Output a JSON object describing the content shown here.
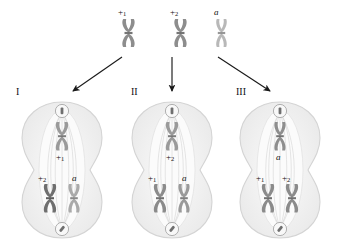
{
  "figure": {
    "background": "#ffffff"
  },
  "parents": {
    "items": [
      {
        "id": "p1",
        "label": "+",
        "sub": "1",
        "italic": false,
        "shade": "#8d8d8d",
        "x": 120,
        "y": 18
      },
      {
        "id": "p2",
        "label": "+",
        "sub": "2",
        "italic": false,
        "shade": "#8d8d8d",
        "x": 172,
        "y": 18
      },
      {
        "id": "p3",
        "label": "a",
        "sub": "",
        "italic": true,
        "shade": "#b8b8b8",
        "x": 213,
        "y": 18
      }
    ],
    "label_positions": [
      {
        "x": 118,
        "y": 8
      },
      {
        "x": 170,
        "y": 8
      },
      {
        "x": 213,
        "y": 8
      }
    ]
  },
  "arrows": {
    "color": "#1a1a1a",
    "items": [
      {
        "name": "arrow-to-cell-I",
        "x1": 122,
        "y1": 57,
        "x2": 72,
        "y2": 92
      },
      {
        "name": "arrow-to-cell-II",
        "x1": 172,
        "y1": 57,
        "x2": 172,
        "y2": 92
      },
      {
        "name": "arrow-to-cell-III",
        "x1": 218,
        "y1": 57,
        "x2": 272,
        "y2": 92
      }
    ]
  },
  "cells": [
    {
      "id": "cell-I",
      "numeral": "I",
      "numeral_x": 16,
      "numeral_y": 88,
      "x": 14,
      "y": 100,
      "top_chromosome": {
        "geno": "+",
        "sub": "1",
        "italic": false,
        "shade": "#9a9a9a"
      },
      "bottom_left": {
        "geno": "+",
        "sub": "2",
        "italic": false,
        "shade": "#6f6f6f"
      },
      "bottom_right": {
        "geno": "a",
        "sub": "",
        "italic": true,
        "shade": "#aaaaaa"
      }
    },
    {
      "id": "cell-II",
      "numeral": "II",
      "numeral_x": 131,
      "numeral_y": 88,
      "x": 124,
      "y": 100,
      "top_chromosome": {
        "geno": "+",
        "sub": "2",
        "italic": false,
        "shade": "#9a9a9a"
      },
      "bottom_left": {
        "geno": "+",
        "sub": "1",
        "italic": false,
        "shade": "#8b8b8b"
      },
      "bottom_right": {
        "geno": "a",
        "sub": "",
        "italic": true,
        "shade": "#9a9a9a"
      }
    },
    {
      "id": "cell-III",
      "numeral": "III",
      "numeral_x": 236,
      "numeral_y": 88,
      "x": 232,
      "y": 100,
      "top_chromosome": {
        "geno": "a",
        "sub": "",
        "italic": true,
        "shade": "#8e8e8e"
      },
      "bottom_left": {
        "geno": "+",
        "sub": "1",
        "italic": false,
        "shade": "#8b8b8b"
      },
      "bottom_right": {
        "geno": "+",
        "sub": "2",
        "italic": false,
        "shade": "#8b8b8b"
      }
    }
  ],
  "cell_art": {
    "membrane_fill": "#eeeeee",
    "membrane_stroke": "#d6d6d6",
    "cytoplasm_fill": "#f3f3f3",
    "spindle_fill": "#fbfbfb",
    "spindle_fiber": "#d0d0d0",
    "centrosome_fill": "#f7f7f7",
    "centrosome_stroke": "#9d9d9d"
  }
}
